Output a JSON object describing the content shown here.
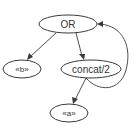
{
  "diagram": {
    "type": "directed-graph",
    "colors": {
      "stroke": "#3a3a3a",
      "text": "#333333",
      "background": "#ffffff"
    },
    "nodes": [
      {
        "id": "or",
        "label": "OR",
        "cx": 68,
        "cy": 24,
        "rx": 29,
        "ry": 9
      },
      {
        "id": "b",
        "label": "«b»",
        "cx": 22,
        "cy": 69,
        "rx": 19,
        "ry": 9
      },
      {
        "id": "concat",
        "label": "concat/2",
        "cx": 91,
        "cy": 69,
        "rx": 30,
        "ry": 9
      },
      {
        "id": "a",
        "label": "«a»",
        "cx": 69,
        "cy": 113,
        "rx": 19,
        "ry": 9
      }
    ],
    "edges": [
      {
        "from": "or",
        "to": "b"
      },
      {
        "from": "or",
        "to": "concat"
      },
      {
        "from": "concat",
        "to": "a"
      },
      {
        "from": "concat",
        "to": "or"
      }
    ]
  }
}
